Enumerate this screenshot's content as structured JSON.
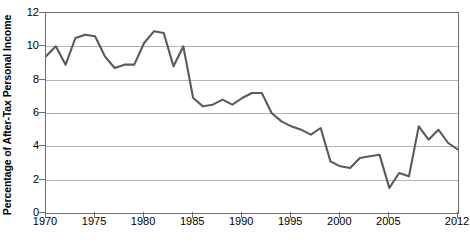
{
  "chart_data": {
    "type": "line",
    "title": "",
    "subtitle": "",
    "xlabel": "",
    "ylabel": "Percentage of After-Tax Personal Income",
    "xlim": [
      1970,
      2012
    ],
    "ylim": [
      0,
      12
    ],
    "grid": true,
    "legend": "none",
    "line_color": "#5a5a5a",
    "grid_color": "#b4b4b4",
    "axis_color": "#6f6f6f",
    "y_ticks": [
      0,
      2,
      4,
      6,
      8,
      10,
      12
    ],
    "y_tick_labels": [
      "0",
      "2",
      "4",
      "6",
      "8",
      "10",
      "12"
    ],
    "x_ticks": [
      1970,
      1975,
      1980,
      1985,
      1990,
      1995,
      2000,
      2005,
      2012
    ],
    "x_tick_labels": [
      "1970",
      "1975",
      "1980",
      "1985",
      "1990",
      "1995",
      "2000",
      "2005",
      "2012"
    ],
    "x": [
      1970,
      1971,
      1972,
      1973,
      1974,
      1975,
      1976,
      1977,
      1978,
      1979,
      1980,
      1981,
      1982,
      1983,
      1984,
      1985,
      1986,
      1987,
      1988,
      1989,
      1990,
      1991,
      1992,
      1993,
      1994,
      1995,
      1996,
      1997,
      1998,
      1999,
      2000,
      2001,
      2002,
      2003,
      2004,
      2005,
      2006,
      2007,
      2008,
      2009,
      2010,
      2011,
      2012
    ],
    "series": [
      {
        "name": "Personal Saving Rate",
        "values": [
          9.4,
          10.0,
          8.9,
          10.5,
          10.7,
          10.6,
          9.4,
          8.7,
          8.9,
          8.9,
          10.2,
          10.9,
          10.8,
          8.8,
          10.0,
          6.9,
          6.4,
          6.5,
          6.8,
          6.5,
          6.9,
          7.2,
          7.2,
          6.0,
          5.5,
          5.2,
          5.0,
          4.7,
          5.1,
          3.1,
          2.8,
          2.7,
          3.3,
          3.4,
          3.5,
          1.5,
          2.4,
          2.2,
          5.2,
          4.4,
          5.0,
          4.2,
          3.8
        ]
      }
    ]
  }
}
